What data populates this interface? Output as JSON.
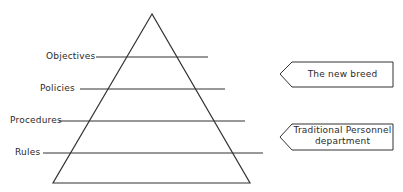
{
  "diagram": {
    "type": "pyramid",
    "levels": [
      {
        "label": "Objectives"
      },
      {
        "label": "Policies"
      },
      {
        "label": "Procedures"
      },
      {
        "label": "Rules"
      }
    ],
    "callouts": [
      {
        "label": "The new breed",
        "points_to_level": "Objectives-Policies"
      },
      {
        "label_line1": "Traditional Personnel",
        "label_line2": "department",
        "points_to_level": "Procedures-Rules"
      }
    ],
    "colors": {
      "line": "#333333",
      "background": "#ffffff"
    }
  }
}
